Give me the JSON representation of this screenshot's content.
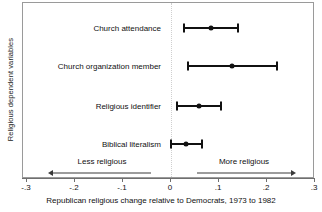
{
  "chart_data": {
    "type": "scatter",
    "title": "",
    "xlabel": "Republican religious change relative to Democrats, 1973 to 1982",
    "ylabel": "Religious dependent variables",
    "xlim": [
      -0.3,
      0.3
    ],
    "xticks": [
      -0.3,
      -0.2,
      -0.1,
      0,
      0.1,
      0.2,
      0.3
    ],
    "xticklabels": [
      "-.3",
      "-.2",
      "-.1",
      "0",
      ".1",
      ".2",
      ".3"
    ],
    "grid": false,
    "legend": null,
    "zero_reference_line": 0,
    "categories": [
      "Church attendance",
      "Church organization member",
      "Religious identifier",
      "Biblical literalism"
    ],
    "values": [
      0.083,
      0.128,
      0.058,
      0.032
    ],
    "ci_low": [
      0.027,
      0.035,
      0.012,
      0.0
    ],
    "ci_high": [
      0.14,
      0.22,
      0.105,
      0.065
    ],
    "points": [
      {
        "label": "Church attendance",
        "estimate": 0.083,
        "ci_low": 0.027,
        "ci_high": 0.14,
        "row_y": 25
      },
      {
        "label": "Church organization member",
        "estimate": 0.128,
        "ci_low": 0.035,
        "ci_high": 0.22,
        "row_y": 63
      },
      {
        "label": "Religious identifier",
        "estimate": 0.058,
        "ci_low": 0.012,
        "ci_high": 0.105,
        "row_y": 103
      },
      {
        "label": "Biblical literalism",
        "estimate": 0.032,
        "ci_low": 0.0,
        "ci_high": 0.065,
        "row_y": 141
      }
    ],
    "annotations": [
      {
        "text": "Less religious",
        "direction": "left",
        "label_x": 101,
        "label_y": 160,
        "line_from": 150,
        "line_to": 52,
        "arrow_y": 172
      },
      {
        "text": "More religious",
        "direction": "right",
        "label_x": 243,
        "label_y": 160,
        "line_from": 196,
        "line_to": 290,
        "arrow_y": 172
      }
    ],
    "colors": {
      "marker": "#111111",
      "ci": "#111111",
      "zero_line": "#cfcfcf",
      "frame": "#9a9a9a",
      "axis": "#6f6f6f",
      "background": "#ffffff"
    }
  },
  "axis_geometry": {
    "plot_left": 22,
    "plot_right": 314,
    "plot_top": 2,
    "plot_bottom": 178,
    "x_zero_px": 170,
    "px_per_unit": 480
  }
}
